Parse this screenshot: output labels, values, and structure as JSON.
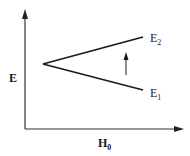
{
  "diagram": {
    "type": "energy-level splitting",
    "y_axis": {
      "label": "E"
    },
    "x_axis": {
      "label": "H",
      "label_subscript": "0"
    },
    "levels": [
      {
        "name": "E",
        "subscript": "2",
        "description": "upper level, rises with field"
      },
      {
        "name": "E",
        "subscript": "1",
        "description": "lower level, falls with field"
      }
    ],
    "transition_arrow": {
      "direction": "up",
      "from": "E1",
      "to": "E2"
    },
    "colors": {
      "lines": "#1a1a1a",
      "axes": "#333333",
      "background": "#ffffff"
    }
  }
}
